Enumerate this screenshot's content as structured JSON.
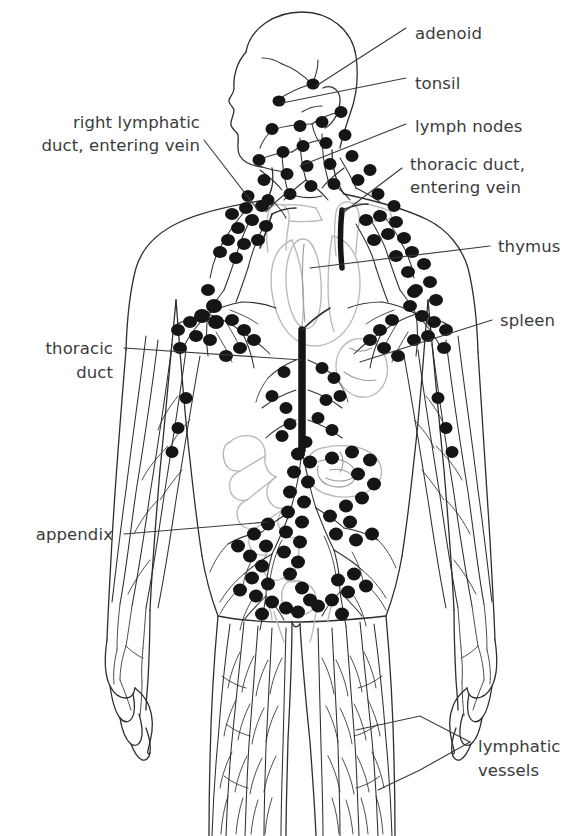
{
  "figure": {
    "background_color": "#ffffff",
    "ink_color": "#2e2e2e",
    "text_color": "#3b3b3b",
    "node_color": "#151515",
    "organ_color": "#b9b9b9"
  },
  "labels": [
    {
      "id": "adenoid",
      "text": "adenoid",
      "side": "right",
      "x": 415,
      "y": 33,
      "lines": [
        "adenoid"
      ]
    },
    {
      "id": "tonsil",
      "text": "tonsil",
      "side": "right",
      "x": 415,
      "y": 83,
      "lines": [
        "tonsil"
      ]
    },
    {
      "id": "lymph-nodes",
      "text": "lymph nodes",
      "side": "right",
      "x": 415,
      "y": 130,
      "lines": [
        "lymph nodes"
      ]
    },
    {
      "id": "thoracic-duct-vein",
      "text": "thoracic duct, entering vein",
      "side": "right",
      "x": 410,
      "y": 170,
      "lines": [
        "thoracic duct,",
        "entering vein"
      ]
    },
    {
      "id": "thymus",
      "text": "thymus",
      "side": "right",
      "x": 498,
      "y": 250,
      "lines": [
        "thymus"
      ]
    },
    {
      "id": "spleen",
      "text": "spleen",
      "side": "right",
      "x": 500,
      "y": 324,
      "lines": [
        "spleen"
      ]
    },
    {
      "id": "lymphatic-vessels",
      "text": "lymphatic vessels",
      "side": "right",
      "x": 478,
      "y": 746,
      "lines": [
        "lymphatic",
        "vessels"
      ]
    },
    {
      "id": "right-lymphatic-duct",
      "text": "right lymphatic duct, entering vein",
      "side": "left",
      "x": 200,
      "y": 127,
      "lines": [
        "right lymphatic",
        "duct, entering vein"
      ]
    },
    {
      "id": "thoracic-duct",
      "text": "thoracic duct",
      "side": "left",
      "x": 113,
      "y": 352,
      "lines": [
        "thoracic",
        "duct"
      ]
    },
    {
      "id": "appendix",
      "text": "appendix",
      "side": "left",
      "x": 113,
      "y": 538,
      "lines": [
        "appendix"
      ]
    }
  ],
  "anatomy": {
    "organs": [
      {
        "name": "adenoid",
        "note": "nasopharyngeal tonsil, behind nose"
      },
      {
        "name": "tonsil",
        "note": "palatine tonsil, throat"
      },
      {
        "name": "thymus",
        "note": "bilobed gland behind sternum"
      },
      {
        "name": "spleen",
        "note": "upper left abdomen"
      },
      {
        "name": "appendix",
        "note": "lower right abdomen, attached to cecum"
      },
      {
        "name": "cecum / large intestine",
        "note": "gray outline, left of midline"
      },
      {
        "name": "small intestine",
        "note": "coiled gray outline"
      },
      {
        "name": "heart",
        "note": "gray outline, center chest"
      },
      {
        "name": "subclavian veins",
        "note": "gray tubes at shoulders where ducts drain"
      }
    ],
    "structures": [
      {
        "name": "thoracic duct",
        "note": "thick dark trunk along midline of abdomen/chest"
      },
      {
        "name": "right lymphatic duct",
        "note": "short duct draining into right subclavian vein"
      },
      {
        "name": "lymph nodes",
        "note": "filled black ovals clustered at neck, axilla, thorax, abdomen, groin"
      },
      {
        "name": "lymphatic vessels",
        "note": "fine branching lines throughout limbs and trunk"
      }
    ],
    "node_clusters": [
      {
        "region": "cervical",
        "approx_count": 26
      },
      {
        "region": "supraclavicular",
        "approx_count": 12
      },
      {
        "region": "axillary",
        "approx_count": 18
      },
      {
        "region": "thoracic",
        "approx_count": 10
      },
      {
        "region": "abdominal / lumbar",
        "approx_count": 30
      },
      {
        "region": "inguinal",
        "approx_count": 22
      },
      {
        "region": "upper arm",
        "approx_count": 6
      }
    ]
  }
}
